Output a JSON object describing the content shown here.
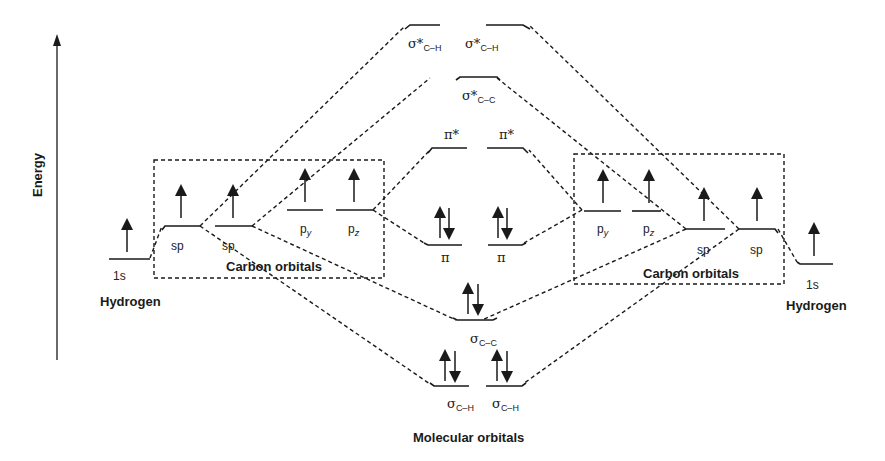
{
  "axis": {
    "label": "Energy"
  },
  "left": {
    "hydrogen_label": "Hydrogen",
    "h_orbital": "1s",
    "carbon_box_label": "Carbon orbitals",
    "orbitals": {
      "sp1": "sp",
      "sp2": "sp",
      "py": "p",
      "py_sub": "y",
      "pz": "p",
      "pz_sub": "z"
    }
  },
  "right": {
    "hydrogen_label": "Hydrogen",
    "h_orbital": "1s",
    "carbon_box_label": "Carbon orbitals",
    "orbitals": {
      "sp1": "sp",
      "sp2": "sp",
      "py": "p",
      "py_sub": "y",
      "pz": "p",
      "pz_sub": "z"
    }
  },
  "molecular": {
    "title": "Molecular orbitals",
    "sigma_star_ch_1": {
      "sym": "σ*",
      "sub": "C–H"
    },
    "sigma_star_ch_2": {
      "sym": "σ*",
      "sub": "C–H"
    },
    "sigma_star_cc": {
      "sym": "σ*",
      "sub": "C–C"
    },
    "pi_star_1": "π*",
    "pi_star_2": "π*",
    "pi_1": "π",
    "pi_2": "π",
    "sigma_cc": {
      "sym": "σ",
      "sub": "C–C"
    },
    "sigma_ch_1": {
      "sym": "σ",
      "sub": "C–H"
    },
    "sigma_ch_2": {
      "sym": "σ",
      "sub": "C–H"
    }
  }
}
